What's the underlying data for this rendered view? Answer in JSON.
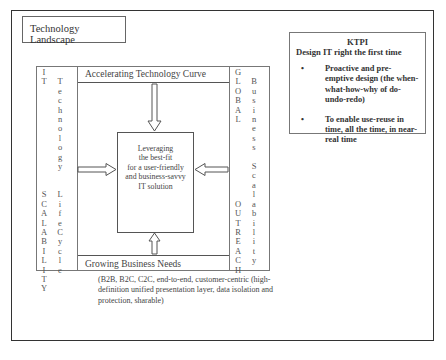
{
  "title": "Technology Landscape",
  "diagram": {
    "top_header": "Accelerating Technology Curve",
    "bottom_footer": "Growing Business Needs",
    "left_column": {
      "outer_letters": [
        "I",
        "T",
        "",
        "",
        "",
        "",
        "",
        "",
        "",
        "",
        "",
        "",
        "",
        "S",
        "C",
        "A",
        "L",
        "A",
        "B",
        "I",
        "L",
        "I",
        "T",
        "Y"
      ],
      "inner_letters": [
        "",
        "T",
        "e",
        "c",
        "h",
        "n",
        "o",
        "l",
        "o",
        "g",
        "y",
        "",
        "",
        "L",
        "i",
        "f",
        "e",
        "C",
        "y",
        "c",
        "l",
        "e",
        "",
        ""
      ],
      "outer_label": "IT SCALABILITY",
      "inner_label": "Technology LifeCycle"
    },
    "right_column": {
      "outer_letters": [
        "G",
        "L",
        "O",
        "B",
        "A",
        "L",
        "",
        "",
        "",
        "",
        "",
        "",
        "",
        "",
        "O",
        "U",
        "T",
        "R",
        "E",
        "A",
        "C",
        "H"
      ],
      "inner_letters": [
        "",
        "B",
        "u",
        "s",
        "i",
        "n",
        "e",
        "s",
        "s",
        "",
        "S",
        "c",
        "a",
        "l",
        "a",
        "b",
        "i",
        "l",
        "i",
        "t",
        "y",
        ""
      ],
      "outer_label": "GLOBAL OUTREACH",
      "inner_label": "Business Scalability"
    },
    "center_text": [
      "Leveraging",
      "the best-fit",
      "for a user-friendly",
      "and business-savvy",
      "IT solution"
    ],
    "arrows": [
      "from-top",
      "from-left",
      "from-right",
      "from-bottom"
    ]
  },
  "ktpi": {
    "heading": "KTPI",
    "subheading": "Design IT right the first time",
    "bullets": [
      "Proactive and pre-emptive design (the when-what-how-why of do-undo-redo)",
      "To enable use-reuse in time, all the time, in near-real time"
    ],
    "bullet_glyph": "•"
  },
  "notes": "(B2B, B2C, C2C, end-to-end, customer-centric (high-definition unified presentation layer, data isolation and protection, sharable)"
}
